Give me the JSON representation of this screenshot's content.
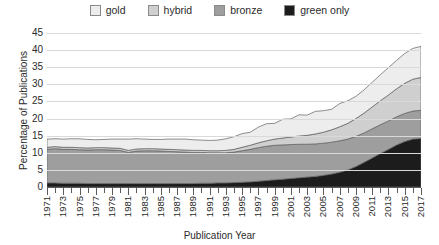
{
  "chart_data": {
    "type": "area",
    "stacked": true,
    "title": "",
    "xlabel": "Publication Year",
    "ylabel": "Percentage of Publications",
    "ylim": [
      0,
      45
    ],
    "ytick_step": 5,
    "yticks": [
      0,
      5,
      10,
      15,
      20,
      25,
      30,
      35,
      40,
      45
    ],
    "grid": true,
    "legend_position": "top",
    "x": [
      1971,
      1972,
      1973,
      1974,
      1975,
      1976,
      1977,
      1978,
      1979,
      1980,
      1981,
      1982,
      1983,
      1984,
      1985,
      1986,
      1987,
      1988,
      1989,
      1990,
      1991,
      1992,
      1993,
      1994,
      1995,
      1996,
      1997,
      1998,
      1999,
      2000,
      2001,
      2002,
      2003,
      2004,
      2005,
      2006,
      2007,
      2008,
      2009,
      2010,
      2011,
      2012,
      2013,
      2014,
      2015,
      2016,
      2017
    ],
    "xtick_labels": [
      "1971",
      "1973",
      "1975",
      "1977",
      "1979",
      "1981",
      "1983",
      "1985",
      "1987",
      "1989",
      "1991",
      "1993",
      "1995",
      "1997",
      "1999",
      "2001",
      "2003",
      "2005",
      "2007",
      "2009",
      "2011",
      "2013",
      "2015",
      "2017"
    ],
    "series": [
      {
        "name": "green only",
        "color": "#1c1c1c",
        "values": [
          1.2,
          1.2,
          1.1,
          1.1,
          1.1,
          1.0,
          1.0,
          1.0,
          1.0,
          1.0,
          1.0,
          1.0,
          1.0,
          1.0,
          1.0,
          1.0,
          1.0,
          1.0,
          1.0,
          1.1,
          1.1,
          1.2,
          1.2,
          1.3,
          1.4,
          1.5,
          1.7,
          1.9,
          2.1,
          2.3,
          2.5,
          2.7,
          2.9,
          3.1,
          3.4,
          3.8,
          4.3,
          5.0,
          6.0,
          7.2,
          8.5,
          9.8,
          11.0,
          12.3,
          13.3,
          14.0,
          14.2
        ]
      },
      {
        "name": "bronze",
        "color": "#9e9e9e",
        "values": [
          9.8,
          10.0,
          9.9,
          9.9,
          9.8,
          9.8,
          9.9,
          9.9,
          9.8,
          9.7,
          9.1,
          9.5,
          9.6,
          9.6,
          9.5,
          9.4,
          9.3,
          9.2,
          9.1,
          9.0,
          8.9,
          8.8,
          8.8,
          8.9,
          9.2,
          9.5,
          9.8,
          10.0,
          10.1,
          10.0,
          9.9,
          9.8,
          9.6,
          9.5,
          9.4,
          9.3,
          9.2,
          9.0,
          8.8,
          8.6,
          8.5,
          8.4,
          8.3,
          8.2,
          8.2,
          8.2,
          8.2
        ]
      },
      {
        "name": "hybrid",
        "color": "#cfcfcf",
        "values": [
          0.6,
          0.6,
          0.6,
          0.6,
          0.6,
          0.6,
          0.6,
          0.6,
          0.6,
          0.6,
          0.6,
          0.6,
          0.6,
          0.6,
          0.6,
          0.6,
          0.6,
          0.6,
          0.6,
          0.6,
          0.6,
          0.6,
          0.7,
          0.8,
          1.0,
          1.2,
          1.4,
          1.6,
          1.8,
          2.0,
          2.2,
          2.4,
          2.6,
          2.9,
          3.2,
          3.6,
          4.1,
          4.6,
          5.2,
          5.8,
          6.4,
          7.0,
          7.6,
          8.2,
          8.8,
          9.3,
          9.6
        ]
      },
      {
        "name": "gold",
        "color": "#ededed",
        "values": [
          2.4,
          2.3,
          2.4,
          2.5,
          2.6,
          2.5,
          2.3,
          2.4,
          2.6,
          2.7,
          3.3,
          3.0,
          2.8,
          2.7,
          2.8,
          3.0,
          3.1,
          3.2,
          3.1,
          3.0,
          3.0,
          3.1,
          3.4,
          3.7,
          4.0,
          3.8,
          4.6,
          5.0,
          4.6,
          5.5,
          5.3,
          6.2,
          5.9,
          6.6,
          6.3,
          6.0,
          6.8,
          6.6,
          6.5,
          6.8,
          7.2,
          7.6,
          8.0,
          8.3,
          8.7,
          9.0,
          9.1
        ]
      }
    ]
  },
  "legend": {
    "items": [
      {
        "label": "gold",
        "color": "#ededed"
      },
      {
        "label": "hybrid",
        "color": "#cfcfcf"
      },
      {
        "label": "bronze",
        "color": "#9e9e9e"
      },
      {
        "label": "green only",
        "color": "#1c1c1c"
      }
    ]
  },
  "axes": {
    "y_title": "Percentage of Publications",
    "x_title": "Publication Year"
  }
}
